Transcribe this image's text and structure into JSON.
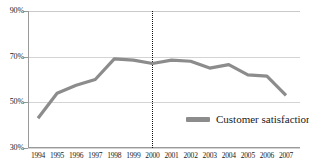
{
  "chart_data": {
    "type": "line",
    "title": "",
    "subtitle": "",
    "xlabel": "",
    "ylabel": "",
    "x": [
      1994,
      1995,
      1996,
      1997,
      1998,
      1999,
      2000,
      2001,
      2002,
      2003,
      2004,
      2005,
      2006,
      2007
    ],
    "categories": [
      "1994",
      "1995",
      "1996",
      "1997",
      "1998",
      "1999",
      "2000",
      "2001",
      "2002",
      "2003",
      "2004",
      "2005",
      "2006",
      "2007"
    ],
    "series": [
      {
        "name": "Customer satisfaction",
        "color": "#8c8c8c",
        "values": [
          43,
          54,
          57.5,
          60,
          69,
          68.5,
          67,
          68.5,
          68,
          65,
          66.5,
          62,
          61.5,
          53
        ]
      }
    ],
    "ylim": [
      30,
      90
    ],
    "ytick_values": [
      30,
      50,
      70,
      90
    ],
    "ytick_labels": [
      "30%",
      "50%",
      "70%",
      "90%"
    ],
    "xtick_labels": [
      "1994",
      "1995",
      "1996",
      "1997",
      "1998",
      "1999",
      "2000",
      "2001",
      "2002",
      "2003",
      "2004",
      "2005",
      "2006",
      "2007"
    ],
    "grid": true,
    "grid_axis": "y",
    "legend": {
      "position": "inside-bottom-right",
      "entries": [
        {
          "label": "Customer satisfaction",
          "color": "#8c8c8c",
          "marker": "line-swatch"
        }
      ]
    },
    "annotations": [
      {
        "type": "vertical-line",
        "name": "year-2000-marker",
        "x": 2000,
        "style": "dotted",
        "color": "#111111"
      }
    ]
  },
  "colors": {
    "series_line": "#8c8c8c",
    "gridline": "#d4d4d4",
    "axis": "#9a9a9a",
    "marker_line": "#111111",
    "text": "#1a1a1a",
    "background": "#ffffff"
  }
}
